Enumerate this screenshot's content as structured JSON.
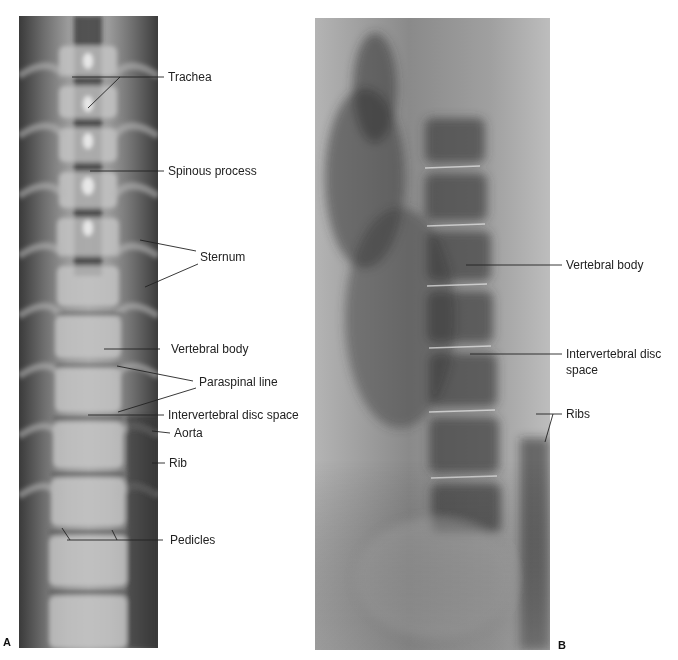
{
  "figure": {
    "panels": [
      {
        "id": "A",
        "letter": "A",
        "view": "frontal radiograph of thoracic spine",
        "labels": [
          {
            "text": "Trachea"
          },
          {
            "text": "Spinous process"
          },
          {
            "text": "Sternum"
          },
          {
            "text": "Vertebral body"
          },
          {
            "text": "Paraspinal line"
          },
          {
            "text": "Intervertebral disc space"
          },
          {
            "text": "Aorta"
          },
          {
            "text": "Rib"
          },
          {
            "text": "Pedicles"
          }
        ]
      },
      {
        "id": "B",
        "letter": "B",
        "view": "lateral radiograph of thoracic spine",
        "labels": [
          {
            "text": "Vertebral body"
          },
          {
            "text": "Intervertebral disc"
          },
          {
            "text": "space"
          },
          {
            "text": "Ribs"
          }
        ]
      }
    ],
    "caption_partial": "FIGURE (caption cut off)"
  },
  "colors": {
    "leader_line": "#222222",
    "label_text": "#222222",
    "background": "#ffffff"
  }
}
